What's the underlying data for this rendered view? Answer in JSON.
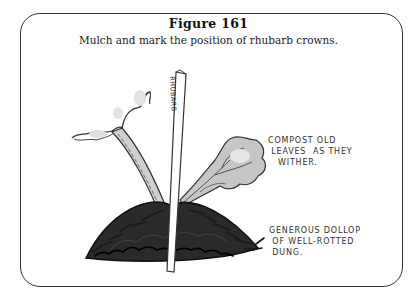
{
  "figure": {
    "title": "Figure 161",
    "caption": "Mulch and mark the position of rhubarb crowns."
  },
  "illustration": {
    "subject": "rhubarb crown in mulch with plant marker",
    "marker_label": "RHUBARB",
    "annotations": [
      {
        "id": "compost",
        "text": "COMPOST OLD\n LEAVES  AS THEY\n   WITHER."
      },
      {
        "id": "dung",
        "text": "GENEROUS DOLLOP\n OF WELL-ROTTED\n DUNG."
      }
    ],
    "colors": {
      "line": "#333333",
      "leaf_shade": "#bbbbbb",
      "mulch": "#1a1a1a"
    }
  }
}
